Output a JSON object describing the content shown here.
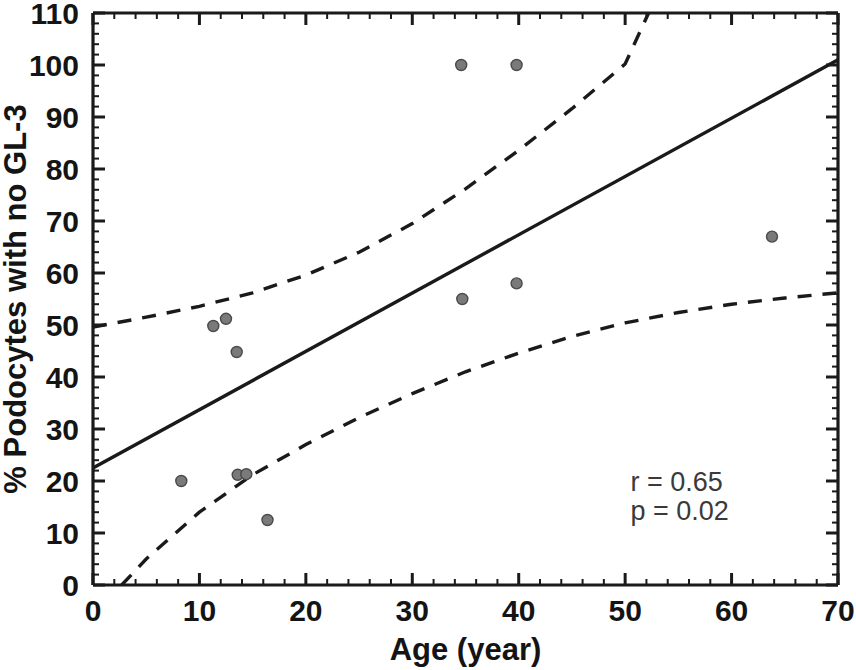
{
  "chart_data": {
    "type": "scatter",
    "title": "",
    "xlabel": "Age (year)",
    "ylabel": "% Podocytes with no GL-3",
    "xlim": [
      0,
      70
    ],
    "ylim": [
      0,
      110
    ],
    "xticks": [
      0,
      10,
      20,
      30,
      40,
      50,
      60,
      70
    ],
    "yticks": [
      0,
      10,
      20,
      30,
      40,
      50,
      60,
      70,
      80,
      90,
      100,
      110
    ],
    "xtick_labels": [
      "0",
      "10",
      "20",
      "30",
      "40",
      "50",
      "60",
      "70"
    ],
    "ytick_labels": [
      "0",
      "10",
      "20",
      "30",
      "40",
      "50",
      "60",
      "70",
      "80",
      "90",
      "100",
      "110"
    ],
    "x_minor_tick_step": 2,
    "y_minor_tick_step": 2,
    "grid": false,
    "legend": null,
    "marker": {
      "shape": "circle",
      "fill_color": "#7a7a7a",
      "edge_color": "#4a4a4a",
      "size_px": 11
    },
    "points": [
      {
        "x": 8.3,
        "y": 20.0
      },
      {
        "x": 11.3,
        "y": 49.8
      },
      {
        "x": 12.5,
        "y": 51.2
      },
      {
        "x": 13.5,
        "y": 44.8
      },
      {
        "x": 13.6,
        "y": 21.2
      },
      {
        "x": 14.4,
        "y": 21.3
      },
      {
        "x": 16.4,
        "y": 12.5
      },
      {
        "x": 34.6,
        "y": 100.0
      },
      {
        "x": 34.7,
        "y": 55.0
      },
      {
        "x": 39.8,
        "y": 100.0
      },
      {
        "x": 39.8,
        "y": 58.0
      },
      {
        "x": 63.8,
        "y": 67.0
      }
    ],
    "regression_line": {
      "style": "solid",
      "color": "#1a1a1a",
      "x_start": 0,
      "y_start": 22.5,
      "x_end": 70,
      "y_end": 101.0
    },
    "confidence_bands": [
      {
        "name": "upper-confidence-band",
        "style": "dashed",
        "color": "#1a1a1a",
        "points": [
          {
            "x": 0,
            "y": 49.6
          },
          {
            "x": 5,
            "y": 51.5
          },
          {
            "x": 10,
            "y": 53.6
          },
          {
            "x": 15,
            "y": 56.2
          },
          {
            "x": 20,
            "y": 59.6
          },
          {
            "x": 25,
            "y": 64.0
          },
          {
            "x": 30,
            "y": 69.5
          },
          {
            "x": 35,
            "y": 76.2
          },
          {
            "x": 40,
            "y": 83.6
          },
          {
            "x": 45,
            "y": 91.6
          },
          {
            "x": 50,
            "y": 100.2
          },
          {
            "x": 52.2,
            "y": 110.0
          }
        ]
      },
      {
        "name": "lower-confidence-band",
        "style": "dashed",
        "color": "#1a1a1a",
        "points": [
          {
            "x": 2.7,
            "y": 0.0
          },
          {
            "x": 5,
            "y": 5.0
          },
          {
            "x": 10,
            "y": 14.0
          },
          {
            "x": 15,
            "y": 21.2
          },
          {
            "x": 20,
            "y": 27.0
          },
          {
            "x": 25,
            "y": 32.2
          },
          {
            "x": 30,
            "y": 36.8
          },
          {
            "x": 35,
            "y": 41.0
          },
          {
            "x": 40,
            "y": 44.6
          },
          {
            "x": 45,
            "y": 47.8
          },
          {
            "x": 50,
            "y": 50.4
          },
          {
            "x": 55,
            "y": 52.4
          },
          {
            "x": 60,
            "y": 54.0
          },
          {
            "x": 65,
            "y": 55.2
          },
          {
            "x": 70,
            "y": 56.2
          }
        ]
      }
    ],
    "annotations": [
      {
        "name": "correlation-coefficient",
        "text": "r = 0.65",
        "x": 50.5,
        "y": 18.0
      },
      {
        "name": "p-value",
        "text": "p = 0.02",
        "x": 50.5,
        "y": 12.5
      }
    ]
  }
}
